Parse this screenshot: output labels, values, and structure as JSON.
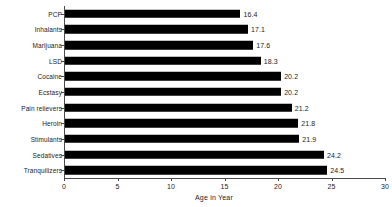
{
  "chart_data": {
    "type": "bar",
    "orientation": "horizontal",
    "title": "",
    "xlabel": "Age in Year",
    "ylabel": "",
    "xlim": [
      0,
      30
    ],
    "xticks": [
      "0",
      "5",
      "10",
      "15",
      "20",
      "25",
      "30"
    ],
    "grid": false,
    "legend": null,
    "bar_color": "#000000",
    "axis_color": "#4a4a4a",
    "background": "#ffffff",
    "categories": [
      "PCP",
      "Inhalants",
      "Marijuana",
      "LSD",
      "Cocaine",
      "Ecstasy",
      "Pain relievers",
      "Heroin",
      "Stimulants",
      "Sedatives",
      "Tranquilizers"
    ],
    "values": [
      16.4,
      17.1,
      17.6,
      18.3,
      20.2,
      20.2,
      21.2,
      21.8,
      21.9,
      24.2,
      24.5
    ],
    "value_labels": [
      "16.4",
      "17.1",
      "17.6",
      "18.3",
      "20.2",
      "20.2",
      "21.2",
      "21.8",
      "21.9",
      "24.2",
      "24.5"
    ]
  }
}
